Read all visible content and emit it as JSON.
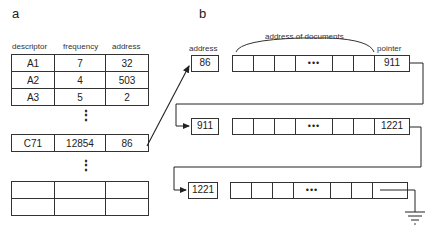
{
  "panel_a": {
    "label": "a",
    "headers": [
      "descriptor",
      "frequency",
      "address"
    ],
    "rows_top": [
      [
        "A1",
        "7",
        "32"
      ],
      [
        "A2",
        "4",
        "503"
      ],
      [
        "A3",
        "5",
        "2"
      ]
    ],
    "row_mid": [
      "C71",
      "12854",
      "86"
    ],
    "rows_bottom": [
      [
        "",
        "",
        ""
      ],
      [
        "",
        "",
        ""
      ]
    ],
    "ellipsis": "⋮"
  },
  "panel_b": {
    "label": "b",
    "address_label": "address",
    "documents_label": "address of documents",
    "pointer_label": "pointer",
    "dots": "•••",
    "records": [
      {
        "address": "86",
        "pointer": "911"
      },
      {
        "address": "911",
        "pointer": "1221"
      },
      {
        "address": "1221",
        "pointer": ""
      }
    ],
    "terminator": "ground-icon"
  }
}
